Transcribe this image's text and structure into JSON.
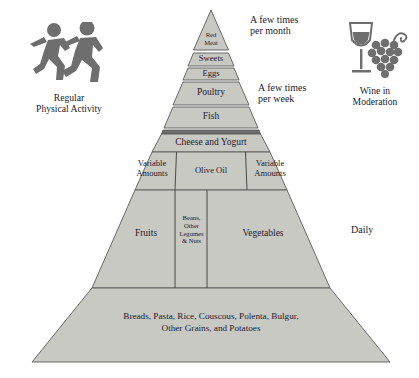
{
  "diagram": {
    "type": "food-pyramid",
    "name": "Mediterranean Diet Pyramid",
    "fill_color": "#c9c9c4",
    "stroke_color": "#5a5a5a",
    "band_color": "#6f6f6f",
    "text_color": "#1a1a2e",
    "icon_color": "#6e6e6e",
    "background": "#ffffff"
  },
  "tiers": [
    {
      "label": "Red\nMeat"
    },
    {
      "label": "Sweets"
    },
    {
      "label": "Eggs"
    },
    {
      "label": "Poultry"
    },
    {
      "label": "Fish"
    },
    {
      "label": "Cheese and Yogurt"
    }
  ],
  "variable_row": {
    "left": "Variable\nAmounts",
    "center": "Olive Oil",
    "right": "Variable\nAmounts"
  },
  "produce_row": {
    "left": "Fruits",
    "center": "Beans,\nOther\nLegumes\n& Nuts",
    "right": "Vegetables"
  },
  "base_row": {
    "label": "Breads, Pasta, Rice, Couscous, Polenta, Bulgur,\nOther Grains, and Potatoes"
  },
  "frequency_labels": {
    "month": "A few times\nper month",
    "week": "A few times\nper week",
    "daily": "Daily"
  },
  "side_icons": {
    "left": {
      "icon": "running-people-icon",
      "caption": "Regular\nPhysical Activity"
    },
    "right": {
      "icon": "wine-glass-grapes-icon",
      "caption": "Wine in\nModeration"
    }
  }
}
